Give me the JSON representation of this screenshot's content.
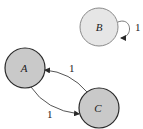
{
  "diagram": {
    "type": "directed-graph",
    "nodes": [
      {
        "id": "A",
        "label": "A",
        "cx": 25,
        "cy": 68,
        "r": 20,
        "fill": "#c9c9c9",
        "stroke": "#2a2a2a"
      },
      {
        "id": "B",
        "label": "B",
        "cx": 99,
        "cy": 27,
        "r": 19,
        "fill": "#e6e6e6",
        "stroke": "#8a8a8a"
      },
      {
        "id": "C",
        "label": "C",
        "cx": 99,
        "cy": 108,
        "r": 20,
        "fill": "#c9c9c9",
        "stroke": "#2a2a2a"
      }
    ],
    "edges": [
      {
        "from": "B",
        "to": "B",
        "label": "1",
        "kind": "self-loop"
      },
      {
        "from": "C",
        "to": "A",
        "label": "1"
      },
      {
        "from": "A",
        "to": "C",
        "label": "1"
      }
    ]
  }
}
